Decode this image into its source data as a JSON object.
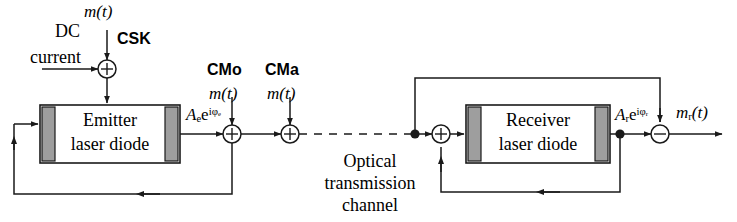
{
  "diagram": {
    "background_color": "#ffffff",
    "line_color": "#1a1a1a",
    "facet_fill": "#9e9e9e",
    "box_fill": "#ffffff"
  },
  "labels": {
    "dc_line1": "DC",
    "dc_line2": "current",
    "input_mt": "m(t)",
    "csk": "CSK",
    "cmo": "CMo",
    "cmo_mt": "m(t)",
    "cma": "CMa",
    "cma_mt": "m(t)",
    "emitter_line1": "Emitter",
    "emitter_line2": "laser diode",
    "receiver_line1": "Receiver",
    "receiver_line2": "laser diode",
    "channel_line1": "Optical",
    "channel_line2": "transmission",
    "channel_line3": "channel",
    "emitter_field_base": "A",
    "emitter_field_sub": "e",
    "emitter_field_exp_base": "e",
    "emitter_field_exp": "iφ",
    "emitter_field_exp_sub": "e",
    "receiver_field_base": "A",
    "receiver_field_sub": "r",
    "receiver_field_exp_base": "e",
    "receiver_field_exp": "iφ",
    "receiver_field_exp_sub": "r",
    "output_base": "m",
    "output_sub": "r",
    "output_arg": "(t)"
  },
  "nodes": {
    "dc_adder": {
      "symbol": "+",
      "x": 107,
      "y": 69
    },
    "cmo_adder": {
      "symbol": "+",
      "x": 232,
      "y": 134
    },
    "cma_adder": {
      "symbol": "+",
      "x": 290,
      "y": 134
    },
    "receiver_adder": {
      "symbol": "+",
      "x": 441,
      "y": 134
    },
    "output_node": {
      "symbol": "−",
      "x": 660,
      "y": 134
    }
  },
  "blocks": {
    "emitter": {
      "x": 40,
      "y": 105,
      "w": 140,
      "h": 58
    },
    "receiver": {
      "x": 466,
      "y": 105,
      "w": 144,
      "h": 58
    }
  }
}
